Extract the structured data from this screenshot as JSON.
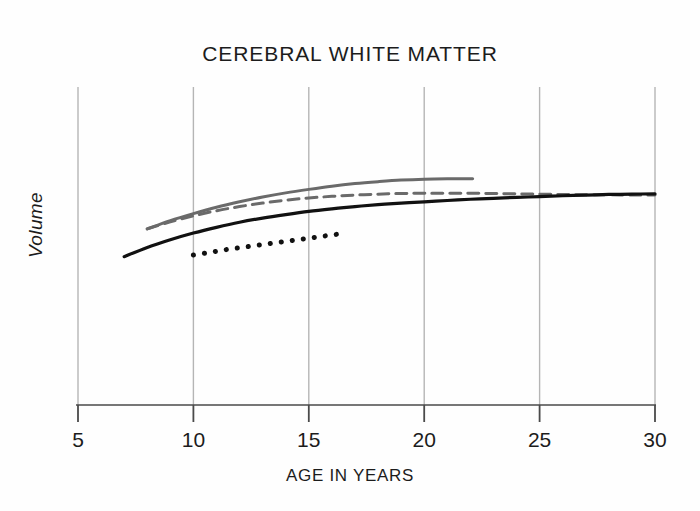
{
  "chart_data": {
    "type": "line",
    "title": "CEREBRAL WHITE MATTER",
    "xlabel": "AGE IN YEARS",
    "ylabel": "Volume",
    "xlim": [
      4.0,
      30.6
    ],
    "ylim": [
      0,
      1
    ],
    "grid": "vertical-only",
    "legend": "none",
    "xticks": [
      5,
      10,
      15,
      20,
      25,
      30
    ],
    "xtick_labels": [
      "5",
      "10",
      "15",
      "20",
      "25",
      "30"
    ],
    "yticks": [],
    "ytick_labels": [],
    "y_axis_note": "Volume axis is unlabeled (arbitrary units, no tick values shown)",
    "series": [
      {
        "name": "gray-solid",
        "style": "solid",
        "color": "#6a6a6a",
        "width": 3.0,
        "x": [
          8.0,
          9.0,
          10.0,
          11.0,
          12.0,
          13.0,
          14.0,
          15.0,
          16.0,
          17.0,
          18.0,
          19.0,
          20.0,
          21.0,
          22.1
        ],
        "y": [
          0.552,
          0.578,
          0.6,
          0.62,
          0.637,
          0.652,
          0.665,
          0.676,
          0.686,
          0.694,
          0.7,
          0.705,
          0.708,
          0.709,
          0.709
        ]
      },
      {
        "name": "gray-dashed",
        "style": "dashed",
        "color": "#6a6a6a",
        "width": 3.0,
        "x": [
          8.0,
          9.0,
          10.0,
          11.0,
          12.0,
          13.0,
          14.0,
          15.0,
          16.0,
          17.0,
          18.0,
          19.0,
          20.0,
          21.0,
          22.0,
          23.0,
          24.0,
          25.0,
          26.0,
          27.0,
          28.0,
          29.0,
          30.0
        ],
        "y": [
          0.552,
          0.574,
          0.593,
          0.609,
          0.622,
          0.633,
          0.642,
          0.649,
          0.654,
          0.658,
          0.661,
          0.663,
          0.664,
          0.664,
          0.664,
          0.663,
          0.662,
          0.661,
          0.66,
          0.659,
          0.659,
          0.658,
          0.658
        ]
      },
      {
        "name": "black-solid",
        "style": "solid",
        "color": "#111111",
        "width": 3.2,
        "x": [
          7.0,
          8.0,
          9.0,
          10.0,
          11.0,
          12.0,
          13.0,
          14.0,
          15.0,
          16.0,
          17.0,
          18.0,
          19.0,
          20.0,
          21.0,
          22.0,
          23.0,
          24.0,
          25.0,
          26.0,
          27.0,
          28.0,
          29.0,
          30.0
        ],
        "y": [
          0.465,
          0.494,
          0.518,
          0.539,
          0.557,
          0.573,
          0.586,
          0.597,
          0.607,
          0.615,
          0.622,
          0.628,
          0.633,
          0.637,
          0.641,
          0.645,
          0.648,
          0.651,
          0.653,
          0.656,
          0.658,
          0.66,
          0.661,
          0.662
        ]
      },
      {
        "name": "black-dotted",
        "style": "dotted",
        "color": "#111111",
        "width": 5.0,
        "x": [
          10.0,
          10.5,
          11.0,
          11.5,
          12.0,
          12.5,
          13.0,
          13.5,
          14.0,
          14.5,
          15.0,
          15.5,
          16.0,
          16.3
        ],
        "y": [
          0.47,
          0.476,
          0.482,
          0.488,
          0.493,
          0.498,
          0.503,
          0.508,
          0.513,
          0.518,
          0.523,
          0.528,
          0.533,
          0.536
        ]
      }
    ],
    "colors": {
      "gray_series": "#6a6a6a",
      "black_series": "#111111",
      "gridline": "#b5b5b5",
      "axis": "#4a4a4a",
      "background": "#fefefe",
      "text": "#1c1c1c"
    }
  }
}
